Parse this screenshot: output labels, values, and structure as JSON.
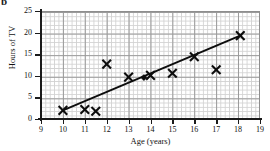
{
  "part_label": "b",
  "chart_data": {
    "type": "scatter",
    "title": "",
    "xlabel": "Age (years)",
    "ylabel": "Hours of TV",
    "xlim": [
      9,
      19
    ],
    "ylim": [
      0,
      25
    ],
    "xticks": [
      9,
      10,
      11,
      12,
      13,
      14,
      15,
      16,
      17,
      18,
      19
    ],
    "yticks": [
      0,
      5,
      10,
      15,
      20,
      25
    ],
    "xtick_labels": [
      "9",
      "10",
      "11",
      "12",
      "13",
      "14",
      "15",
      "16",
      "17",
      "18",
      "19"
    ],
    "ytick_labels": [
      "0",
      "5",
      "10",
      "15",
      "20",
      "25"
    ],
    "x_minor_divisions": 5,
    "y_minor_divisions": 5,
    "grid": true,
    "legend": "none",
    "series": [
      {
        "name": "Data points",
        "marker": "x-cross",
        "points": [
          {
            "x": 10.0,
            "y": 2.0
          },
          {
            "x": 11.0,
            "y": 2.2
          },
          {
            "x": 11.5,
            "y": 1.8
          },
          {
            "x": 12.0,
            "y": 12.7
          },
          {
            "x": 13.0,
            "y": 9.7
          },
          {
            "x": 14.0,
            "y": 10.1
          },
          {
            "x": 15.0,
            "y": 10.6
          },
          {
            "x": 16.0,
            "y": 14.4
          },
          {
            "x": 17.0,
            "y": 11.4
          },
          {
            "x": 18.1,
            "y": 19.3
          }
        ]
      },
      {
        "name": "Mean point",
        "marker": "filled-diamond",
        "points": [
          {
            "x": 13.7,
            "y": 9.6
          }
        ]
      },
      {
        "name": "Line of best fit",
        "marker": "line",
        "points": [
          {
            "x": 10.0,
            "y": 2.0
          },
          {
            "x": 18.15,
            "y": 19.4
          }
        ]
      }
    ]
  }
}
